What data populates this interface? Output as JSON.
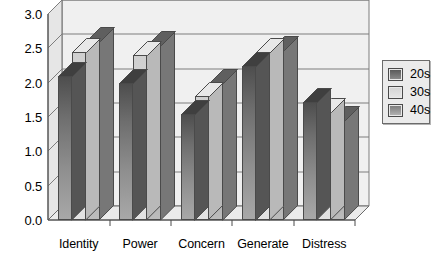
{
  "chart_data": {
    "type": "bar",
    "title": "",
    "subtitle": "",
    "xlabel": "",
    "ylabel": "",
    "ylim": [
      0.0,
      3.0
    ],
    "ytick_step": 0.5,
    "ytick_labels": [
      "3.0",
      "2.5",
      "2.0",
      "1.5",
      "1.0",
      "0.5",
      "0.0"
    ],
    "ytick_values": [
      3.0,
      2.5,
      2.0,
      1.5,
      1.0,
      0.5,
      0.0
    ],
    "grid": "horizontal",
    "legend_position": "right",
    "style": "3d-grouped-bars-grayscale",
    "categories": [
      "Identity",
      "Power",
      "Concern",
      "Generate",
      "Distress"
    ],
    "series": [
      {
        "name": "20s",
        "color": "#6e6e6e",
        "values": [
          2.1,
          2.0,
          1.55,
          2.25,
          1.72
        ]
      },
      {
        "name": "30s",
        "color": "#d9d9d9",
        "values": [
          2.45,
          2.4,
          1.8,
          2.45,
          1.57
        ]
      },
      {
        "name": "40s",
        "color": "#949494",
        "values": [
          2.6,
          2.55,
          2.0,
          2.47,
          1.45
        ]
      }
    ]
  },
  "legend": {
    "entries": [
      {
        "label": "20s"
      },
      {
        "label": "30s"
      },
      {
        "label": "40s"
      }
    ]
  },
  "colors": {
    "background": "#ffffff",
    "plot_face": "#f2f2f2",
    "wall_shade": "#e4e4e4",
    "floor_shade": "#ededed",
    "axis_line": "#4a4a4a",
    "grid_line": "#7d7d7d",
    "text": "#000000"
  }
}
